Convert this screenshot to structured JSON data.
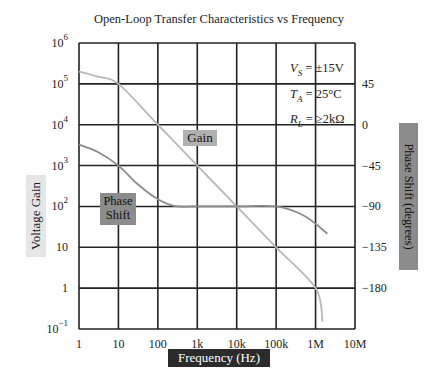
{
  "chart_data": {
    "type": "line",
    "title": "Open-Loop Transfer Characteristics vs Frequency",
    "xlabel": "Frequency (Hz)",
    "ylabel": "Voltage Gain",
    "y2label": "Phase Shift (degrees)",
    "xscale": "log",
    "yscale": "log",
    "xlim": [
      1,
      10000000
    ],
    "ylim": [
      0.1,
      1000000
    ],
    "y2lim": [
      -225,
      90
    ],
    "x_tick_labels": [
      "1",
      "10",
      "100",
      "1k",
      "10k",
      "100k",
      "1M",
      "10M"
    ],
    "y_tick_labels": [
      {
        "base": "10",
        "exp": "6"
      },
      {
        "base": "10",
        "exp": "5"
      },
      {
        "base": "10",
        "exp": "4"
      },
      {
        "base": "10",
        "exp": "3"
      },
      {
        "base": "10",
        "exp": "2"
      },
      {
        "base": "10",
        "exp": ""
      },
      {
        "base": "1",
        "exp": ""
      },
      {
        "base": "10",
        "exp": "−1"
      }
    ],
    "y2_tick_labels": [
      "45",
      "0",
      "−45",
      "−90",
      "−135",
      "−180"
    ],
    "grid": true,
    "annotations": {
      "conditions": [
        "V_S = ±15V",
        "T_A = 25°C",
        "R_L = ≥2kΩ"
      ],
      "gain_tag": "Gain",
      "phase_tag": [
        "Phase",
        "Shift"
      ]
    },
    "series": [
      {
        "name": "Gain",
        "axis": "left",
        "color": "#b8b8b8",
        "x": [
          1,
          3,
          10,
          100,
          1000,
          10000,
          100000,
          1000000,
          1500000
        ],
        "y": [
          200000,
          150000,
          100000,
          10000,
          1000,
          100,
          10,
          1,
          0.15
        ]
      },
      {
        "name": "Phase Shift",
        "axis": "right",
        "color": "#8c8c8c",
        "x": [
          1,
          3,
          10,
          30,
          100,
          300,
          1000,
          10000,
          100000,
          500000,
          2000000
        ],
        "y": [
          -22,
          -30,
          -45,
          -65,
          -82,
          -90,
          -90,
          -90,
          -90,
          -100,
          -120
        ]
      }
    ]
  }
}
